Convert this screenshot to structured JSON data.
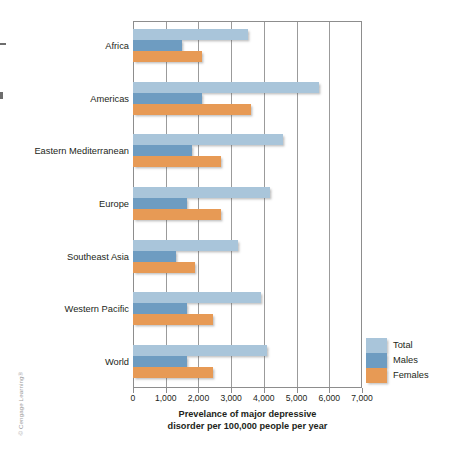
{
  "credit": "© Cengage Learning®",
  "chart_data": {
    "type": "bar",
    "orientation": "horizontal",
    "title": "",
    "xlabel": "Prevelance of major depressive disorder per 100,000 people per year",
    "xlabel_line1": "Prevelance of major depressive",
    "xlabel_line2": "disorder per 100,000 people per year",
    "ylabel": "",
    "xlim": [
      0,
      7000
    ],
    "xticks": [
      0,
      1000,
      2000,
      3000,
      4000,
      5000,
      6000,
      7000
    ],
    "xtick_labels": [
      "0",
      "1,000",
      "2,000",
      "3,000",
      "4,000",
      "5,000",
      "6,000",
      "7,000"
    ],
    "grid": true,
    "grid_axis": "x",
    "legend_position": "right-bottom",
    "categories": [
      "Africa",
      "Americas",
      "Eastern Mediterranean",
      "Europe",
      "Southeast Asia",
      "Western Pacific",
      "World"
    ],
    "series": [
      {
        "name": "Total",
        "color": "#a9c5da",
        "values": [
          3500,
          5700,
          4600,
          4200,
          3200,
          3900,
          4100
        ]
      },
      {
        "name": "Males",
        "color": "#6e9cc1",
        "values": [
          1500,
          2100,
          1800,
          1650,
          1300,
          1650,
          1650
        ]
      },
      {
        "name": "Females",
        "color": "#e79a55",
        "values": [
          2100,
          3600,
          2700,
          2700,
          1900,
          2450,
          2450
        ]
      }
    ]
  },
  "legend": {
    "items": [
      {
        "label": "Total",
        "color": "#a9c5da"
      },
      {
        "label": "Males",
        "color": "#6e9cc1"
      },
      {
        "label": "Females",
        "color": "#e79a55"
      }
    ]
  }
}
